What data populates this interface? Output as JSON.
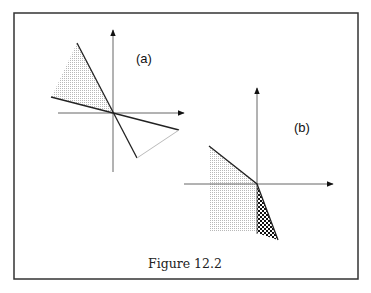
{
  "figure": {
    "caption": "Figure 12.2",
    "panels": [
      {
        "id": "a",
        "label": "(a)",
        "description": "Two lines through the origin; shaded wedge in upper-left between them, unshaded triangle in lower-right closed by a light segment"
      },
      {
        "id": "b",
        "label": "(b)",
        "description": "Sloped line from upper-left to origin continuing steeply into lower-right; dotted shaded region in the left half below the line, cross-hatched sliver in the lower-right between y-axis and steep line"
      }
    ]
  },
  "colors": {
    "frame": "#333333",
    "axis": "#666666",
    "line": "#222222",
    "light_line": "#bbbbbb",
    "shade": "#d8d8d8",
    "hatch": "#111111"
  }
}
